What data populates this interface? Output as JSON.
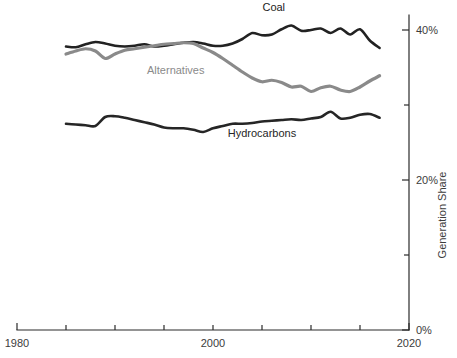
{
  "chart_data": {
    "type": "line",
    "title": "",
    "subtitle": "",
    "xlabel": "",
    "ylabel": "Generation Share",
    "xlim": [
      1980,
      2020
    ],
    "ylim": [
      0,
      42
    ],
    "grid": false,
    "legend_position": "inline-labels",
    "x_ticks": [
      1980,
      1985,
      1990,
      1995,
      2000,
      2005,
      2010,
      2015,
      2020
    ],
    "x_tick_labels": [
      "1980",
      "",
      "",
      "",
      "2000",
      "",
      "",
      "",
      "2020"
    ],
    "y_ticks": [
      0,
      10,
      20,
      30,
      40
    ],
    "y_tick_labels": [
      "0%",
      "",
      "20%",
      "",
      "40%"
    ],
    "x": [
      1985,
      1986,
      1987,
      1988,
      1989,
      1990,
      1991,
      1992,
      1993,
      1994,
      1995,
      1996,
      1997,
      1998,
      1999,
      2000,
      2001,
      2002,
      2003,
      2004,
      2005,
      2006,
      2007,
      2008,
      2009,
      2010,
      2011,
      2012,
      2013,
      2014,
      2015,
      2016,
      2017
    ],
    "series": [
      {
        "name": "Coal",
        "color": "#222222",
        "label_x": 2006.2,
        "label_y": 42.6,
        "values": [
          37.8,
          37.7,
          38.1,
          38.4,
          38.2,
          37.9,
          37.8,
          37.9,
          38.1,
          37.8,
          37.9,
          38.1,
          38.3,
          38.4,
          38.2,
          37.9,
          37.9,
          38.2,
          38.8,
          39.6,
          39.3,
          39.4,
          40.1,
          40.6,
          39.9,
          40.0,
          40.2,
          39.6,
          40.2,
          39.4,
          40.1,
          38.6,
          37.6
        ]
      },
      {
        "name": "Alternatives",
        "color": "#8a8a8a",
        "label_x": 1996.2,
        "label_y": 34.1,
        "values": [
          36.8,
          37.2,
          37.5,
          37.2,
          36.2,
          36.8,
          37.3,
          37.5,
          37.7,
          37.9,
          38.1,
          38.2,
          38.3,
          38.2,
          37.6,
          37.0,
          36.2,
          35.3,
          34.4,
          33.6,
          33.1,
          33.3,
          33.0,
          32.4,
          32.5,
          31.8,
          32.3,
          32.5,
          32.0,
          31.8,
          32.4,
          33.2,
          33.9
        ]
      },
      {
        "name": "Hydrocarbons",
        "color": "#262626",
        "label_x": 2005.0,
        "label_y": 25.8,
        "values": [
          27.5,
          27.4,
          27.3,
          27.2,
          28.4,
          28.5,
          28.3,
          28.0,
          27.7,
          27.4,
          27.0,
          26.9,
          26.9,
          26.7,
          26.4,
          26.9,
          27.2,
          27.5,
          27.5,
          27.6,
          27.8,
          27.9,
          28.0,
          28.1,
          28.0,
          28.2,
          28.4,
          29.1,
          28.2,
          28.3,
          28.7,
          28.8,
          28.3
        ]
      }
    ]
  },
  "geometry": {
    "plot_left": 17,
    "plot_right": 409,
    "y_zero": 330,
    "y_per_pct": 7.5
  }
}
